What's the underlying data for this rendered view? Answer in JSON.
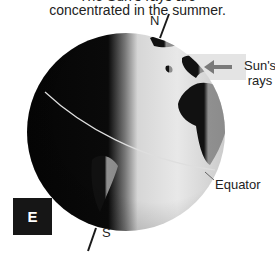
{
  "caption": {
    "line1_partial": "The Sun's rays are",
    "line2": "concentrated in the summer."
  },
  "labels": {
    "north": "N",
    "south": "S",
    "sun_rays_line1": "Sun's",
    "sun_rays_line2": "rays",
    "equator": "Equator"
  },
  "panel_badge": "E",
  "colors": {
    "night": "#080808",
    "day": "#e6e6e6",
    "land": "#8c8c8c",
    "sun_box": "#e4e4e4",
    "arrow": "#7a7a7a",
    "badge_bg": "#161616"
  }
}
